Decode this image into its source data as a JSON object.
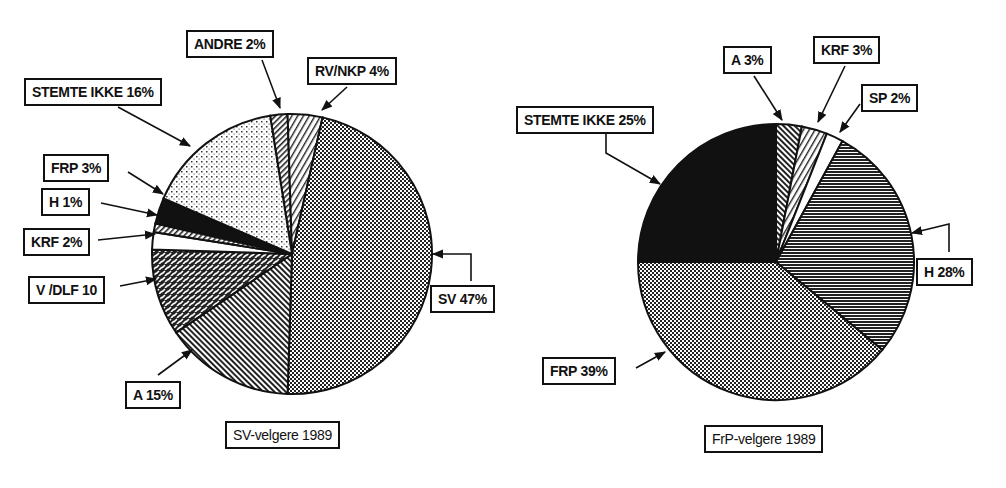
{
  "chart_data": [
    {
      "type": "pie",
      "title": "SV-velgere 1989",
      "start": "top, clockwise",
      "categories": [
        "ANDRE",
        "RV/NKP",
        "SV",
        "A",
        "V /DLF",
        "KRF",
        "H",
        "FRP",
        "STEMTE IKKE"
      ],
      "values": [
        2,
        4,
        47,
        15,
        10,
        2,
        1,
        3,
        16
      ],
      "labels": [
        "ANDRE 2%",
        "RV/NKP 4%",
        "SV 47%",
        "A 15%",
        "V /DLF 10",
        "KRF 2%",
        "H 1%",
        "FRP 3%",
        "STEMTE IKKE 16%"
      ],
      "patterns": [
        "diag-fine",
        "diag-wide",
        "crosshatch-dense",
        "diag-back",
        "brick",
        "white",
        "diag-fine",
        "black",
        "dots-light"
      ]
    },
    {
      "type": "pie",
      "title": "FrP-velgere 1989",
      "start": "top, clockwise",
      "categories": [
        "A",
        "KRF",
        "SP",
        "H",
        "FRP",
        "STEMTE IKKE"
      ],
      "values": [
        3,
        3,
        2,
        28,
        39,
        25
      ],
      "labels": [
        "A  3%",
        "KRF  3%",
        "SP 2%",
        "H  28%",
        "FRP  39%",
        "STEMTE IKKE  25%"
      ],
      "patterns": [
        "diag-back",
        "diag-wide",
        "white",
        "horizontal-dark",
        "crosshatch-dense",
        "black"
      ]
    }
  ],
  "left": {
    "caption": "SV-velgere 1989",
    "labels": {
      "andre": "ANDRE 2%",
      "rvnkp": "RV/NKP 4%",
      "stemte": "STEMTE IKKE  16%",
      "frp": "FRP  3%",
      "h": "H 1%",
      "krf": "KRF 2%",
      "vdlf": "V /DLF 10",
      "a": "A 15%",
      "sv": "SV 47%"
    }
  },
  "right": {
    "caption": "FrP-velgere 1989",
    "labels": {
      "a": "A  3%",
      "krf": "KRF  3%",
      "sp": "SP 2%",
      "stemte": "STEMTE IKKE  25%",
      "h": "H  28%",
      "frp": "FRP  39%"
    }
  },
  "colors": {
    "ink": "#111111",
    "paper": "#ffffff"
  }
}
